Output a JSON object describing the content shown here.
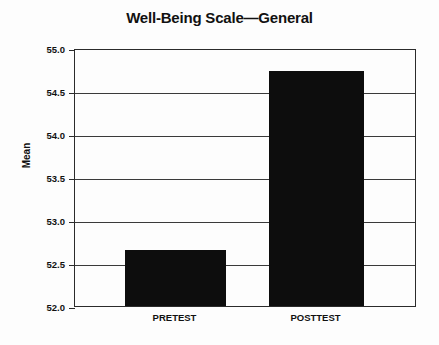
{
  "chart_data": {
    "type": "bar",
    "title": "Well-Being Scale—General",
    "xlabel": "",
    "ylabel": "Mean",
    "categories": [
      "PRETEST",
      "POSTTEST"
    ],
    "values": [
      52.65,
      54.73
    ],
    "ylim": [
      52.0,
      55.0
    ],
    "ytick_labels": [
      "55.0",
      "54.5",
      "54.0",
      "53.5",
      "53.0",
      "52.5",
      "52.0"
    ],
    "ytick_values": [
      55.0,
      54.5,
      54.0,
      53.5,
      53.0,
      52.5,
      52.0
    ],
    "grid": true,
    "legend": "none",
    "bar_color": "#0d0d0d",
    "axis_color": "#2b2b2b",
    "background_color": "#fdfdfd"
  }
}
